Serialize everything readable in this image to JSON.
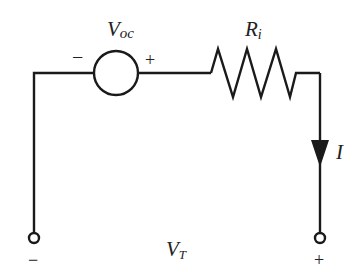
{
  "diagram": {
    "type": "circuit",
    "source": {
      "label_main": "V",
      "label_sub": "oc",
      "neg_sign": "−",
      "pos_sign": "+"
    },
    "resistor": {
      "label_main": "R",
      "label_sub": "i"
    },
    "current": {
      "label": "I",
      "direction": "down"
    },
    "terminals": {
      "label_main": "V",
      "label_sub": "T",
      "left_sign": "−",
      "right_sign": "+"
    },
    "colors": {
      "wire": "#1a1a1a",
      "background": "#ffffff"
    }
  }
}
